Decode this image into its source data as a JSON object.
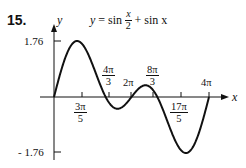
{
  "problem_number": "15.",
  "equation": {
    "lhs": "y",
    "equals": "=",
    "term1_func": "sin",
    "term1_num": "x",
    "term1_den": "2",
    "plus": "+",
    "term2": "sin x"
  },
  "axes": {
    "x_label": "x",
    "y_label": "y"
  },
  "y_ticks": [
    {
      "label": "1.76",
      "value": 1.76
    },
    {
      "label": "- 1.76",
      "value": -1.76
    }
  ],
  "x_ticks": [
    {
      "num": "3π",
      "den": "5",
      "value": "3π/5",
      "position": "below"
    },
    {
      "num": "4π",
      "den": "3",
      "value": "4π/3",
      "position": "above"
    },
    {
      "label": "2π",
      "value": "2π",
      "position": "above"
    },
    {
      "num": "8π",
      "den": "3",
      "value": "8π/3",
      "position": "above"
    },
    {
      "num": "17π",
      "den": "5",
      "value": "17π/5",
      "position": "below"
    },
    {
      "label": "4π",
      "value": "4π",
      "position": "above"
    }
  ],
  "chart_data": {
    "type": "line",
    "xlabel": "x",
    "ylabel": "y",
    "xlim": [
      0,
      12.566
    ],
    "ylim": [
      -1.76,
      1.76
    ],
    "grid": false,
    "legend": null,
    "series": [
      {
        "name": "y = sin(x/2) + sin x",
        "function": "sin(x/2) + sin(x)",
        "key_points": [
          {
            "x": "0",
            "y": 0
          },
          {
            "x": "3π/5",
            "y": 1.76,
            "note": "local max"
          },
          {
            "x": "4π/3",
            "y": 0,
            "note": "zero"
          },
          {
            "x": "2π",
            "y": 0,
            "note": "zero"
          },
          {
            "x": "8π/3",
            "y": 0,
            "note": "zero"
          },
          {
            "x": "17π/5",
            "y": -1.76,
            "note": "local min"
          },
          {
            "x": "4π",
            "y": 0
          }
        ]
      }
    ],
    "annotations": [
      "1.76",
      "-1.76",
      "3π/5",
      "4π/3",
      "2π",
      "8π/3",
      "17π/5",
      "4π"
    ]
  }
}
